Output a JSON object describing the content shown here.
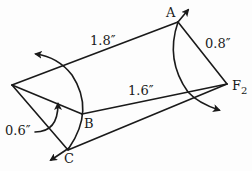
{
  "diagram": {
    "type": "mechanism-linkage",
    "stroke_color": "#1a1a1a",
    "points": {
      "L": {
        "x": 12,
        "y": 85,
        "label": ""
      },
      "A": {
        "x": 178,
        "y": 22,
        "label": "A"
      },
      "F2": {
        "x": 227,
        "y": 84,
        "label": "F",
        "subscript": "2"
      },
      "B": {
        "x": 82,
        "y": 114,
        "label": "B"
      },
      "C": {
        "x": 68,
        "y": 150,
        "label": "C"
      }
    },
    "links": [
      {
        "from": "L",
        "to": "A",
        "length_label": "1.8″"
      },
      {
        "from": "A",
        "to": "F2",
        "length_label": "0.8″"
      },
      {
        "from": "L",
        "to": "B"
      },
      {
        "from": "B",
        "to": "F2",
        "length_label": "1.6″"
      },
      {
        "from": "L",
        "to": "C"
      },
      {
        "from": "C",
        "to": "F2"
      }
    ],
    "dimension_labels": {
      "la": "1.8″",
      "af2": "0.8″",
      "bf2": "1.6″",
      "lb": "0.6″"
    },
    "point_labels": {
      "A": "A",
      "B": "B",
      "C": "C",
      "F": "F",
      "F_sub": "2"
    },
    "arcs": [
      {
        "name": "arc-through-B-C",
        "arrow": "up-left"
      },
      {
        "name": "arc-through-A",
        "arrow": "up-right at A, down-right at bottom"
      },
      {
        "name": "arc-0.6",
        "arrow": "up"
      }
    ]
  }
}
